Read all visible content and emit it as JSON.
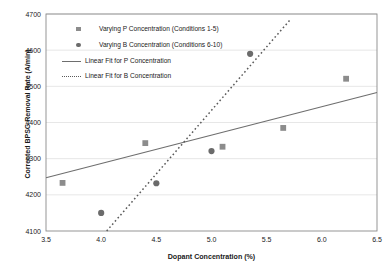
{
  "chart_data": {
    "type": "scatter",
    "title": "",
    "xlabel": "Dopant Concentration (%)",
    "ylabel": "Corrected BPSG Removal Rate (A/min)",
    "xlim": [
      3.5,
      6.5
    ],
    "ylim": [
      4100,
      4700
    ],
    "xticks": [
      "3.5",
      "4.0",
      "4.5",
      "5.0",
      "5.5",
      "6.0",
      "6.5"
    ],
    "xtick_values": [
      3.5,
      4.0,
      4.5,
      5.0,
      5.5,
      6.0,
      6.5
    ],
    "yticks": [
      "4100",
      "4200",
      "4300",
      "4400",
      "4500",
      "4600",
      "4700"
    ],
    "ytick_values": [
      4100,
      4200,
      4300,
      4400,
      4500,
      4600,
      4700
    ],
    "grid": true,
    "grid_axis": "y",
    "legend_position": "upper-left-inside",
    "series": [
      {
        "name": "Varying P Concentration (Conditions 1-5)",
        "marker": "square",
        "color": "#8c8c8c",
        "points": [
          {
            "x": 3.65,
            "y": 4233
          },
          {
            "x": 4.4,
            "y": 4343
          },
          {
            "x": 5.1,
            "y": 4333
          },
          {
            "x": 5.65,
            "y": 4385
          },
          {
            "x": 6.22,
            "y": 4521
          }
        ]
      },
      {
        "name": "Varying B Concentration (Conditions 6-10)",
        "marker": "circle",
        "color": "#6b6b6b",
        "points": [
          {
            "x": 4.0,
            "y": 4150
          },
          {
            "x": 4.5,
            "y": 4232
          },
          {
            "x": 5.0,
            "y": 4321
          },
          {
            "x": 5.35,
            "y": 4590
          }
        ]
      },
      {
        "name": "Linear Fit for P Concentration",
        "marker": "line-solid",
        "color": "#6e6e6e",
        "line": {
          "x1": 3.5,
          "y1": 4247,
          "x2": 6.5,
          "y2": 4483
        }
      },
      {
        "name": "Linear Fit for B Concentration",
        "marker": "line-dotted",
        "color": "#5a5a5a",
        "line": {
          "x1": 4.05,
          "y1": 4100,
          "x2": 5.71,
          "y2": 4683
        }
      }
    ],
    "legend_entries": [
      {
        "label": "Varying P Concentration (Conditions 1-5)",
        "marker": "square"
      },
      {
        "label": "Varying B Concentration (Conditions 6-10)",
        "marker": "circle"
      },
      {
        "label": "Linear Fit for P Concentration",
        "marker": "line-solid"
      },
      {
        "label": "Linear Fit for B Concentration",
        "marker": "line-dotted"
      }
    ]
  }
}
